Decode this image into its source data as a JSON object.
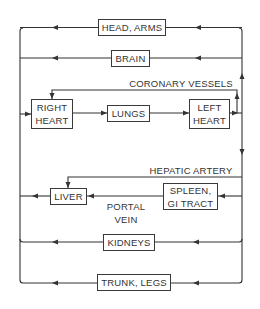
{
  "diagram": {
    "colors": {
      "line": "#333333",
      "text": "#333333",
      "background": "#ffffff"
    },
    "nodes": {
      "head_arms": "HEAD, ARMS",
      "brain": "BRAIN",
      "right_heart": "RIGHT\nHEART",
      "lungs": "LUNGS",
      "left_heart": "LEFT\nHEART",
      "liver": "LIVER",
      "spleen_gi": "SPLEEN,\nGI TRACT",
      "kidneys": "KIDNEYS",
      "trunk_legs": "TRUNK, LEGS"
    },
    "labels": {
      "coronary": "CORONARY VESSELS",
      "hepatic": "HEPATIC ARTERY",
      "portal": "PORTAL\nVEIN"
    },
    "edges": [
      {
        "from": "RIGHT HEART",
        "to": "LUNGS"
      },
      {
        "from": "LUNGS",
        "to": "LEFT HEART"
      },
      {
        "from": "LEFT HEART",
        "to": "HEAD, ARMS"
      },
      {
        "from": "LEFT HEART",
        "to": "BRAIN"
      },
      {
        "from": "LEFT HEART",
        "to": "RIGHT HEART",
        "label": "CORONARY VESSELS"
      },
      {
        "from": "LEFT HEART",
        "to": "LIVER",
        "label": "HEPATIC ARTERY"
      },
      {
        "from": "LEFT HEART",
        "to": "SPLEEN, GI TRACT"
      },
      {
        "from": "SPLEEN, GI TRACT",
        "to": "LIVER",
        "label": "PORTAL VEIN"
      },
      {
        "from": "LEFT HEART",
        "to": "KIDNEYS"
      },
      {
        "from": "LEFT HEART",
        "to": "TRUNK, LEGS"
      },
      {
        "from": "HEAD, ARMS",
        "to": "RIGHT HEART"
      },
      {
        "from": "BRAIN",
        "to": "RIGHT HEART"
      },
      {
        "from": "LIVER",
        "to": "RIGHT HEART"
      },
      {
        "from": "KIDNEYS",
        "to": "RIGHT HEART"
      },
      {
        "from": "TRUNK, LEGS",
        "to": "RIGHT HEART"
      }
    ]
  }
}
